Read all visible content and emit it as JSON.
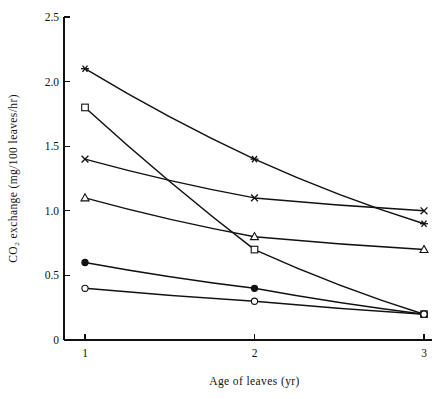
{
  "chart_data": {
    "type": "line",
    "title": "",
    "xlabel": "Age of leaves (yr)",
    "ylabel": "CO₂ exchange (mg/100 leaves/hr)",
    "x": [
      1,
      2,
      3
    ],
    "xlim": [
      0.6,
      3.25
    ],
    "ylim": [
      0,
      2.5
    ],
    "xticks": [
      "1",
      "2",
      "3"
    ],
    "yticks": [
      "0",
      "0.5",
      "1.0",
      "1.5",
      "2.0",
      "2.5"
    ],
    "ytick_values": [
      0,
      0.5,
      1.0,
      1.5,
      2.0,
      2.5
    ],
    "grid": false,
    "legend": "none",
    "line_color": "#111111",
    "series": [
      {
        "name": "series-asterisk",
        "marker": "asterisk-marker",
        "values": [
          2.1,
          1.4,
          0.9
        ]
      },
      {
        "name": "series-open-square",
        "marker": "open-square-marker",
        "values": [
          1.8,
          0.7,
          0.2
        ]
      },
      {
        "name": "series-cross",
        "marker": "cross-marker",
        "values": [
          1.4,
          1.1,
          1.0
        ]
      },
      {
        "name": "series-open-triangle",
        "marker": "open-triangle-marker",
        "values": [
          1.1,
          0.8,
          0.7
        ]
      },
      {
        "name": "series-filled-circle",
        "marker": "filled-circle-marker",
        "values": [
          0.6,
          0.4,
          0.2
        ]
      },
      {
        "name": "series-open-circle",
        "marker": "open-circle-marker",
        "values": [
          0.4,
          0.3,
          0.2
        ]
      }
    ]
  },
  "axes": {
    "y_title": "CO₂ exchange (mg/100 leaves/hr)",
    "x_title": "Age of leaves (yr)"
  }
}
